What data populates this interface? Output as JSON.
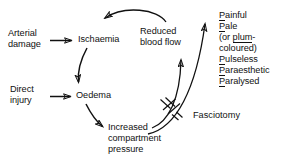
{
  "diagram": {
    "type": "flowchart-cycle",
    "title_visible": false,
    "nodes": [
      {
        "id": "arterial-damage",
        "label": "Arterial\ndamage",
        "x": 8,
        "y": 28
      },
      {
        "id": "ischaemia",
        "label": "Ischaemia",
        "x": 78,
        "y": 34
      },
      {
        "id": "direct-injury",
        "label": "Direct\ninjury",
        "x": 10,
        "y": 84
      },
      {
        "id": "oedema",
        "label": "Oedema",
        "x": 76,
        "y": 90
      },
      {
        "id": "increased-pressure",
        "label": "Increased\ncompartment\npressure",
        "x": 108,
        "y": 122
      },
      {
        "id": "reduced-blood-flow",
        "label": "Reduced\nblood flow",
        "x": 140,
        "y": 26
      },
      {
        "id": "fasciotomy",
        "label": "Fasciotomy",
        "x": 193,
        "y": 110
      }
    ],
    "signs": {
      "id": "five-ps-sign-list",
      "x": 219,
      "y": 10,
      "items": [
        {
          "underlined": "P",
          "rest": "ainful"
        },
        {
          "underlined": "P",
          "rest": "ale"
        },
        {
          "underlined": "plum",
          "rest": "",
          "prefix": "(or ",
          "suffix": "-"
        },
        {
          "underlined": "",
          "rest": "coloured)"
        },
        {
          "underlined": "P",
          "rest": "ulseless"
        },
        {
          "underlined": "P",
          "rest": "araesthetic"
        },
        {
          "underlined": "P",
          "rest": "aralysed"
        }
      ]
    },
    "edges": [
      {
        "id": "arterial-damage-to-ischaemia",
        "from": "arterial-damage",
        "to": "ischaemia",
        "style": "straight"
      },
      {
        "id": "ischaemia-to-oedema",
        "from": "ischaemia",
        "to": "oedema",
        "style": "curved"
      },
      {
        "id": "direct-injury-to-oedema",
        "from": "direct-injury",
        "to": "oedema",
        "style": "straight"
      },
      {
        "id": "oedema-to-increased-pressure",
        "from": "oedema",
        "to": "increased-pressure",
        "style": "curved"
      },
      {
        "id": "increased-pressure-to-reduced-flow",
        "from": "increased-pressure",
        "to": "reduced-blood-flow",
        "style": "curved",
        "interrupted_by": "fasciotomy"
      },
      {
        "id": "increased-pressure-to-signs",
        "from": "increased-pressure",
        "to": "five-ps-sign-list",
        "style": "curved",
        "interrupted_by": "fasciotomy"
      },
      {
        "id": "reduced-flow-to-ischaemia",
        "from": "reduced-blood-flow",
        "to": "ischaemia",
        "style": "curved"
      }
    ],
    "cut_marker": {
      "id": "fasciotomy-cut-marker",
      "description": "hatched cut marks crossing the two upward arrows",
      "x": 163,
      "y": 103
    }
  },
  "colors": {
    "ink": "#111111",
    "background": "#ffffff"
  }
}
